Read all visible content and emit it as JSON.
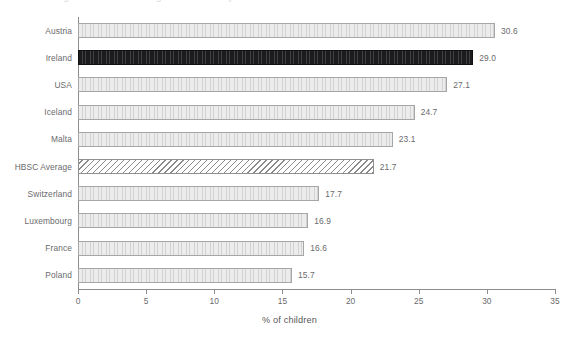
{
  "chart_data": {
    "type": "bar",
    "orientation": "horizontal",
    "title": "Figure: children drinking soft drinks daily",
    "xlabel": "% of children",
    "ylabel": "",
    "xlim": [
      0,
      35
    ],
    "xticks": [
      "0",
      "5",
      "10",
      "15",
      "20",
      "25",
      "30",
      "35"
    ],
    "xtick_values": [
      0,
      5,
      10,
      15,
      20,
      25,
      30,
      35
    ],
    "grid": false,
    "legend": "none",
    "categories": [
      "Austria",
      "Ireland",
      "USA",
      "Iceland",
      "Malta",
      "HBSC Average",
      "Switzerland",
      "Luxembourg",
      "France",
      "Poland"
    ],
    "values": [
      30.6,
      29.0,
      27.1,
      24.7,
      23.1,
      21.7,
      17.7,
      16.9,
      16.6,
      15.7
    ],
    "value_labels": [
      "30.6",
      "29.0",
      "27.1",
      "24.7",
      "23.1",
      "21.7",
      "17.7",
      "16.9",
      "16.6",
      "15.7"
    ],
    "bar_styles": [
      "plain",
      "highlight",
      "plain",
      "plain",
      "plain",
      "hatched",
      "plain",
      "plain",
      "plain",
      "plain"
    ],
    "colors": {
      "bar_fill": "#ececed",
      "bar_edge": "#a6a6a9",
      "highlight_fill": "#1c1c1e",
      "hatch_line": "#8a8a8d",
      "axis": "#8d8d90",
      "text": "#6a6a6d",
      "background": "#ffffff"
    }
  }
}
